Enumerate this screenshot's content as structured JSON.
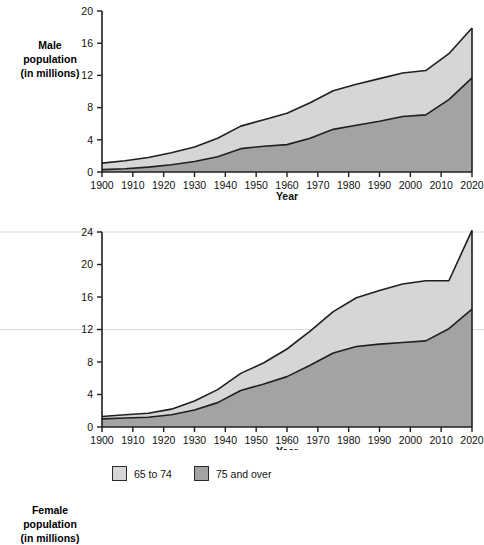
{
  "legend": {
    "items": [
      {
        "label": "65 to 74",
        "color": "#d6d6d6"
      },
      {
        "label": "75 and over",
        "color": "#a3a3a3"
      }
    ]
  },
  "colors": {
    "series_65_74": "#d6d6d6",
    "series_75_over": "#a3a3a3",
    "outline": "#1f1f1f",
    "axis": "#1f1f1f",
    "gridline": "#d9d9d9",
    "background": "#ffffff"
  },
  "chart_data": [
    {
      "type": "area",
      "id": "male-population",
      "title": "",
      "ylabel": "Male population (in millions)",
      "xlabel": "Year",
      "stacked": true,
      "grid": false,
      "legend_position": "bottom",
      "xlim": [
        1900,
        2020
      ],
      "ylim": [
        0,
        20
      ],
      "yticks": [
        0,
        4,
        8,
        12,
        16,
        20
      ],
      "x": [
        1900,
        1910,
        1920,
        1930,
        1940,
        1950,
        1960,
        1970,
        1980,
        1990,
        2000,
        2010,
        2020
      ],
      "xticklabels": [
        "1900",
        "1910",
        "1920",
        "1930",
        "1940",
        "1950",
        "1960",
        "1970",
        "1980",
        "1990",
        "2000",
        "2010",
        "2020"
      ],
      "series": [
        {
          "name": "75 and over",
          "color": "#a3a3a3",
          "values": [
            0.3,
            0.4,
            0.6,
            0.9,
            1.3,
            1.9,
            2.9,
            3.2,
            3.4,
            4.2,
            5.3,
            5.8,
            6.3,
            6.9,
            7.1,
            9.0,
            11.7
          ]
        },
        {
          "name": "65 to 74",
          "color": "#d6d6d6",
          "values": [
            0.8,
            1.0,
            1.2,
            1.5,
            1.8,
            2.3,
            2.8,
            3.3,
            3.9,
            4.4,
            4.8,
            5.1,
            5.3,
            5.4,
            5.5,
            5.7,
            6.2
          ]
        }
      ],
      "totals": [
        1.1,
        1.3,
        1.6,
        2.0,
        2.6,
        3.5,
        4.5,
        5.0,
        5.5,
        6.5,
        7.8,
        9.0,
        10.3,
        11.4,
        12.3,
        12.7,
        17.8
      ],
      "notes": "Stacked area: dark band (75 and over) at bottom, light band (65 to 74) on top."
    },
    {
      "type": "area",
      "id": "female-population",
      "title": "",
      "ylabel": "Female population (in millions)",
      "xlabel": "Year",
      "stacked": true,
      "grid": true,
      "legend_position": "bottom",
      "xlim": [
        1900,
        2020
      ],
      "ylim": [
        0,
        24
      ],
      "yticks": [
        0,
        4,
        8,
        12,
        16,
        20,
        24
      ],
      "x": [
        1900,
        1910,
        1920,
        1930,
        1940,
        1950,
        1960,
        1970,
        1980,
        1990,
        2000,
        2010,
        2020
      ],
      "xticklabels": [
        "1900",
        "1910",
        "1920",
        "1930",
        "1940",
        "1950",
        "1960",
        "1970",
        "1980",
        "1990",
        "2000",
        "2010",
        "2020"
      ],
      "series": [
        {
          "name": "75 and over",
          "color": "#a3a3a3",
          "values": [
            1.0,
            1.1,
            1.2,
            1.5,
            2.1,
            3.0,
            4.5,
            5.3,
            6.2,
            7.6,
            9.1,
            9.9,
            10.2,
            10.4,
            10.6,
            12.1,
            14.5
          ]
        },
        {
          "name": "65 to 74",
          "color": "#d6d6d6",
          "values": [
            0.3,
            0.4,
            0.5,
            0.7,
            1.1,
            1.6,
            2.1,
            2.6,
            3.4,
            4.2,
            5.1,
            6.0,
            6.6,
            7.2,
            7.4,
            5.9,
            9.7
          ]
        }
      ],
      "totals": [
        1.3,
        1.5,
        1.7,
        2.2,
        3.2,
        4.6,
        6.6,
        7.9,
        9.6,
        11.8,
        14.2,
        15.9,
        16.8,
        17.6,
        18.0,
        18.0,
        24.2
      ],
      "notes": "Stacked area with faint horizontal gridlines at y=24 and y=12."
    }
  ]
}
